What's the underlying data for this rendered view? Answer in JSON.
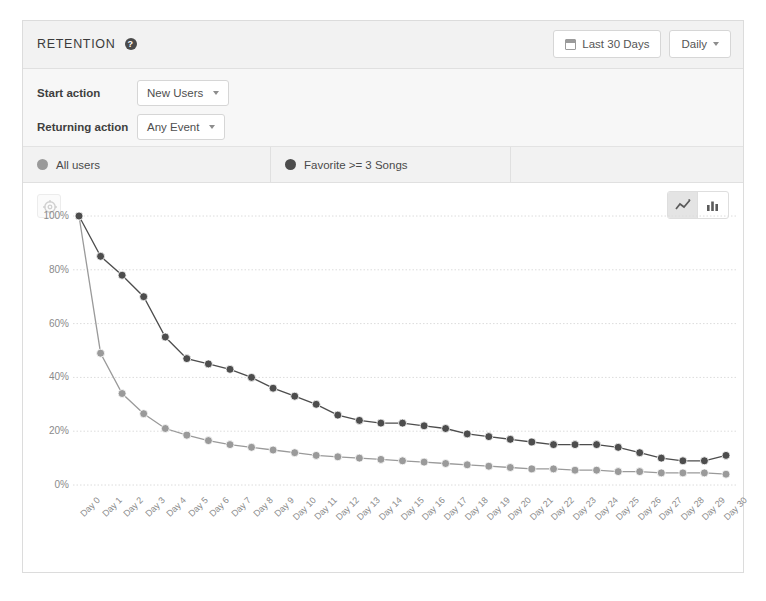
{
  "header": {
    "title": "RETENTION",
    "help_icon": "help-circle-icon",
    "date_range": "Last 30 Days",
    "calendar_icon": "calendar-icon",
    "granularity": "Daily",
    "caret_icon": "chevron-down-icon"
  },
  "filters": {
    "start_action_label": "Start action",
    "start_action_value": "New Users",
    "returning_action_label": "Returning action",
    "returning_action_value": "Any Event"
  },
  "legend": {
    "items": [
      {
        "label": "All users",
        "color": "#9a9a9a",
        "dot_icon": "series-dot-icon"
      },
      {
        "label": "Favorite >= 3 Songs",
        "color": "#4d4d4d",
        "dot_icon": "series-dot-icon"
      }
    ]
  },
  "toolbar": {
    "settings_icon": "gear-icon",
    "line_chart_icon": "line-chart-icon",
    "bar_chart_icon": "bar-chart-icon",
    "active_view": "line"
  },
  "chart_data": {
    "type": "line",
    "title": "",
    "xlabel": "",
    "ylabel": "",
    "ylim": [
      0,
      100
    ],
    "ytick_labels": [
      "100%",
      "80%",
      "60%",
      "40%",
      "20%",
      "0%"
    ],
    "ytick_values": [
      100,
      80,
      60,
      40,
      20,
      0
    ],
    "grid": true,
    "legend_position": "top",
    "categories": [
      "Day 0",
      "Day 1",
      "Day 2",
      "Day 3",
      "Day 4",
      "Day 5",
      "Day 6",
      "Day 7",
      "Day 8",
      "Day 9",
      "Day 10",
      "Day 11",
      "Day 12",
      "Day 13",
      "Day 14",
      "Day 15",
      "Day 16",
      "Day 17",
      "Day 18",
      "Day 19",
      "Day 20",
      "Day 21",
      "Day 22",
      "Day 23",
      "Day 24",
      "Day 25",
      "Day 26",
      "Day 27",
      "Day 28",
      "Day 29",
      "Day 30"
    ],
    "series": [
      {
        "name": "Favorite >= 3 Songs",
        "color": "#4d4d4d",
        "values": [
          100,
          85,
          78,
          70,
          55,
          47,
          45,
          43,
          40,
          36,
          33,
          30,
          26,
          24,
          23,
          23,
          22,
          21,
          19,
          18,
          17,
          16,
          15,
          15,
          15,
          14,
          12,
          10,
          9,
          9,
          11
        ]
      },
      {
        "name": "All users",
        "color": "#9a9a9a",
        "values": [
          100,
          49,
          34,
          26.5,
          21,
          18.5,
          16.5,
          15,
          14,
          13,
          12,
          11,
          10.5,
          10,
          9.5,
          9,
          8.5,
          8,
          7.5,
          7,
          6.5,
          6,
          6,
          5.5,
          5.5,
          5,
          5,
          4.5,
          4.5,
          4.5,
          4
        ]
      }
    ]
  }
}
